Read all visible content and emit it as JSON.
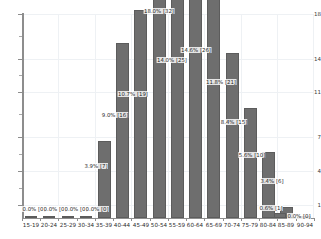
{
  "chart_data": {
    "type": "bar",
    "title": "",
    "subtitle": "",
    "xlabel": "",
    "ylabel": "",
    "grid": true,
    "legend_position": "none",
    "ylim": [
      0,
      18.6
    ],
    "y_ticks_major": [
      1,
      4,
      7,
      11,
      14,
      18
    ],
    "y_tick_labels": [
      "1",
      "4",
      "7",
      "11",
      "14",
      "18"
    ],
    "categories": [
      "15-19",
      "20-24",
      "25-29",
      "30-34",
      "35-39",
      "40-44",
      "45-49",
      "50-54",
      "55-59",
      "60-64",
      "65-69",
      "70-74",
      "75-79",
      "80-84",
      "85-89",
      "90-94"
    ],
    "values": [
      0,
      0,
      0,
      0,
      7,
      16,
      19,
      32,
      25,
      26,
      21,
      15,
      10,
      6,
      1,
      0
    ],
    "percents": [
      0.0,
      0.0,
      0.0,
      0.0,
      3.9,
      9.0,
      10.7,
      18.0,
      14.0,
      14.6,
      11.8,
      8.4,
      5.6,
      3.4,
      0.6,
      0.0
    ],
    "data_labels": [
      "0.0% [0]",
      "0.0% [0]",
      "0.0% [0]",
      "0.0% [0]",
      "3.9% [7]",
      "9.0% [16]",
      "10.7% [19]",
      "18.0% [32]",
      "14.0% [25]",
      "14.6% [26]",
      "11.8% [21]",
      "8.4% [15]",
      "5.6% [10]",
      "3.4% [6]",
      "0.6% [1]",
      "0.0% [0]"
    ],
    "total_count": 178,
    "bar_color": "#6e6e6e",
    "grid_color": "#eef1f4",
    "axis_color": "#8d8d8d"
  }
}
